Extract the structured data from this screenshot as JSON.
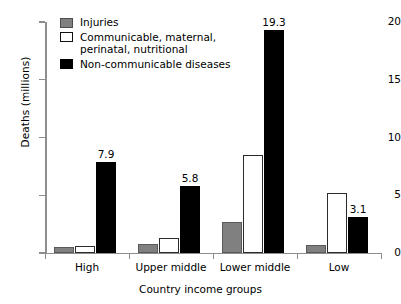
{
  "chart_data": {
    "type": "bar",
    "title": "",
    "xlabel": "Country income groups",
    "ylabel": "Deaths (millions)",
    "categories": [
      "High",
      "Upper middle",
      "Lower middle",
      "Low"
    ],
    "series": [
      {
        "name": "Injuries",
        "color": "#808080",
        "values": [
          0.5,
          0.8,
          2.7,
          0.7
        ],
        "labels": [
          "",
          "",
          "",
          ""
        ]
      },
      {
        "name": "Communicable, maternal,\nperinatal, nutritional",
        "color": "#ffffff",
        "values": [
          0.6,
          1.3,
          8.5,
          5.2
        ],
        "labels": [
          "",
          "",
          "",
          ""
        ]
      },
      {
        "name": "Non-communicable diseases",
        "color": "#000000",
        "values": [
          7.9,
          5.8,
          19.3,
          3.1
        ],
        "labels": [
          "7.9",
          "5.8",
          "19.3",
          "3.1"
        ]
      }
    ],
    "ylim": [
      0,
      20
    ],
    "yticks": [
      0,
      5,
      10,
      15,
      20
    ],
    "ytick_labels": [
      "0",
      "5",
      "10",
      "15",
      "20"
    ],
    "grid": false,
    "legend_position": "top-left"
  },
  "legend": {
    "items": [
      {
        "label": "Injuries",
        "swatch": "injuries"
      },
      {
        "label": "Communicable, maternal,\nperinatal, nutritional",
        "swatch": "communicable"
      },
      {
        "label": "Non-communicable diseases",
        "swatch": "noncommunicable"
      }
    ]
  }
}
